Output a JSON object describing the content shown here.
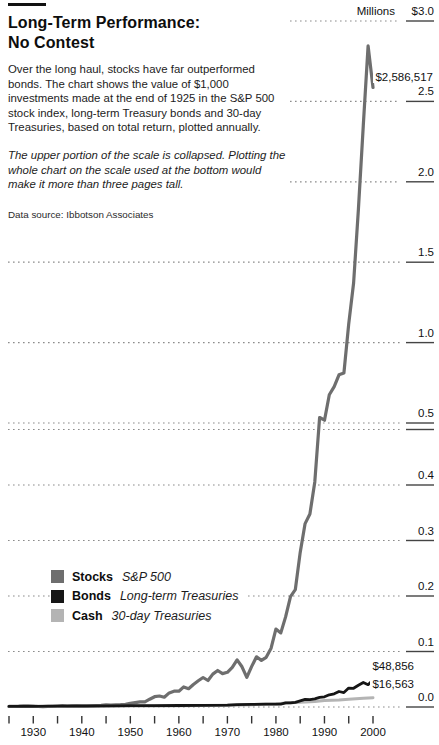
{
  "header": {
    "title_line1": "Long-Term Performance:",
    "title_line2": "No Contest",
    "intro": "Over the long haul, stocks have far outperformed bonds. The chart shows the value of $1,000 investments made at the end of 1925 in the S&P 500 stock index, long-term Treasury bonds and 30-day Treasuries, based on total return, plotted annually.",
    "note": "The upper portion of the scale is collapsed. Plotting the whole chart on the scale used at the bottom would make it more than three pages tall.",
    "source": "Data source: Ibbotson Associates"
  },
  "chart_data": {
    "type": "line",
    "title": "Long-Term Performance: No Contest",
    "unit_label": "Millions",
    "grid": "dotted horizontal gridlines",
    "y_axis": {
      "unit": "Millions of dollars",
      "range": [
        0.0,
        3.0
      ],
      "break_value": 0.5,
      "lower_step": 0.1,
      "upper_step": 0.5,
      "ticks": [
        {
          "value": 3.0,
          "label": "$3.0"
        },
        {
          "value": 2.5,
          "label": "2.5"
        },
        {
          "value": 2.0,
          "label": "2.0"
        },
        {
          "value": 1.5,
          "label": "1.5"
        },
        {
          "value": 1.0,
          "label": "1.0"
        },
        {
          "value": 0.5,
          "label": "0.5"
        },
        {
          "value": 0.4,
          "label": "0.4"
        },
        {
          "value": 0.3,
          "label": "0.3"
        },
        {
          "value": 0.2,
          "label": "0.2"
        },
        {
          "value": 0.1,
          "label": "0.1"
        },
        {
          "value": 0.0,
          "label": "0.0"
        }
      ]
    },
    "x_axis": {
      "range": [
        1925,
        2000
      ],
      "tick_step_years": 5,
      "labels": [
        "1930",
        "1940",
        "1950",
        "1960",
        "1970",
        "1980",
        "1990",
        "2000"
      ],
      "label_years": [
        1930,
        1940,
        1950,
        1960,
        1970,
        1980,
        1990,
        2000
      ]
    },
    "series": [
      {
        "name": "Stocks",
        "desc": "S&P 500",
        "color": "#6e6e6e",
        "width": 3.2,
        "end_label": "$2,586,517",
        "end_value_dollars": 2586517,
        "points": [
          [
            1925,
            0.001
          ],
          [
            1926,
            0.0011
          ],
          [
            1927,
            0.0015
          ],
          [
            1928,
            0.0022
          ],
          [
            1929,
            0.002
          ],
          [
            1930,
            0.0015
          ],
          [
            1931,
            0.0009
          ],
          [
            1932,
            0.0008
          ],
          [
            1933,
            0.0012
          ],
          [
            1934,
            0.0012
          ],
          [
            1935,
            0.0018
          ],
          [
            1936,
            0.0024
          ],
          [
            1937,
            0.0015
          ],
          [
            1938,
            0.002
          ],
          [
            1939,
            0.002
          ],
          [
            1940,
            0.0018
          ],
          [
            1941,
            0.0016
          ],
          [
            1942,
            0.0019
          ],
          [
            1943,
            0.0024
          ],
          [
            1944,
            0.0029
          ],
          [
            1945,
            0.004
          ],
          [
            1946,
            0.0036
          ],
          [
            1947,
            0.0039
          ],
          [
            1948,
            0.0041
          ],
          [
            1949,
            0.0048
          ],
          [
            1950,
            0.0064
          ],
          [
            1951,
            0.0079
          ],
          [
            1952,
            0.0094
          ],
          [
            1953,
            0.0093
          ],
          [
            1954,
            0.0141
          ],
          [
            1955,
            0.0186
          ],
          [
            1956,
            0.0198
          ],
          [
            1957,
            0.0177
          ],
          [
            1958,
            0.0254
          ],
          [
            1959,
            0.0284
          ],
          [
            1960,
            0.0285
          ],
          [
            1961,
            0.0362
          ],
          [
            1962,
            0.033
          ],
          [
            1963,
            0.0405
          ],
          [
            1964,
            0.0472
          ],
          [
            1965,
            0.0531
          ],
          [
            1966,
            0.0477
          ],
          [
            1967,
            0.0592
          ],
          [
            1968,
            0.0657
          ],
          [
            1969,
            0.0601
          ],
          [
            1970,
            0.0625
          ],
          [
            1971,
            0.0714
          ],
          [
            1972,
            0.0849
          ],
          [
            1973,
            0.0725
          ],
          [
            1974,
            0.0533
          ],
          [
            1975,
            0.0731
          ],
          [
            1976,
            0.0905
          ],
          [
            1977,
            0.084
          ],
          [
            1978,
            0.0895
          ],
          [
            1979,
            0.106
          ],
          [
            1980,
            0.1404
          ],
          [
            1981,
            0.1335
          ],
          [
            1982,
            0.1623
          ],
          [
            1983,
            0.1989
          ],
          [
            1984,
            0.2114
          ],
          [
            1985,
            0.2785
          ],
          [
            1986,
            0.3305
          ],
          [
            1987,
            0.3478
          ],
          [
            1988,
            0.4056
          ],
          [
            1989,
            0.5341
          ],
          [
            1990,
            0.5175
          ],
          [
            1991,
            0.6752
          ],
          [
            1992,
            0.7266
          ],
          [
            1993,
            0.7998
          ],
          [
            1994,
            0.8104
          ],
          [
            1995,
            1.1149
          ],
          [
            1996,
            1.3709
          ],
          [
            1997,
            1.8282
          ],
          [
            1998,
            2.3508
          ],
          [
            1999,
            2.8454
          ],
          [
            2000,
            2.5865
          ]
        ]
      },
      {
        "name": "Bonds",
        "desc": "Long-term Treasuries",
        "color": "#161616",
        "width": 2.8,
        "end_label": "$48,856",
        "end_value_dollars": 48856,
        "points": [
          [
            1925,
            0.001
          ],
          [
            1930,
            0.0013
          ],
          [
            1935,
            0.0015
          ],
          [
            1940,
            0.0018
          ],
          [
            1945,
            0.0021
          ],
          [
            1950,
            0.0023
          ],
          [
            1955,
            0.0025
          ],
          [
            1960,
            0.0027
          ],
          [
            1965,
            0.003
          ],
          [
            1970,
            0.0034
          ],
          [
            1972,
            0.0041
          ],
          [
            1975,
            0.0046
          ],
          [
            1978,
            0.0053
          ],
          [
            1980,
            0.0051
          ],
          [
            1981,
            0.0052
          ],
          [
            1982,
            0.0073
          ],
          [
            1983,
            0.0073
          ],
          [
            1984,
            0.0084
          ],
          [
            1985,
            0.011
          ],
          [
            1986,
            0.0137
          ],
          [
            1987,
            0.0134
          ],
          [
            1988,
            0.0147
          ],
          [
            1989,
            0.0173
          ],
          [
            1990,
            0.0184
          ],
          [
            1991,
            0.0219
          ],
          [
            1992,
            0.0237
          ],
          [
            1993,
            0.028
          ],
          [
            1994,
            0.0259
          ],
          [
            1995,
            0.034
          ],
          [
            1996,
            0.0337
          ],
          [
            1997,
            0.0391
          ],
          [
            1998,
            0.0442
          ],
          [
            1999,
            0.0402
          ],
          [
            2000,
            0.0489
          ]
        ]
      },
      {
        "name": "Cash",
        "desc": "30-day Treasuries",
        "color": "#b4b4b4",
        "width": 3.0,
        "end_label": "$16,563",
        "end_value_dollars": 16563,
        "points": [
          [
            1925,
            0.001
          ],
          [
            1935,
            0.0013
          ],
          [
            1945,
            0.0014
          ],
          [
            1950,
            0.0016
          ],
          [
            1955,
            0.0018
          ],
          [
            1960,
            0.0021
          ],
          [
            1965,
            0.0025
          ],
          [
            1970,
            0.0032
          ],
          [
            1975,
            0.0041
          ],
          [
            1980,
            0.0056
          ],
          [
            1982,
            0.0072
          ],
          [
            1985,
            0.0084
          ],
          [
            1988,
            0.0098
          ],
          [
            1990,
            0.0115
          ],
          [
            1993,
            0.0128
          ],
          [
            1995,
            0.014
          ],
          [
            1998,
            0.0156
          ],
          [
            2000,
            0.0166
          ]
        ]
      }
    ]
  }
}
